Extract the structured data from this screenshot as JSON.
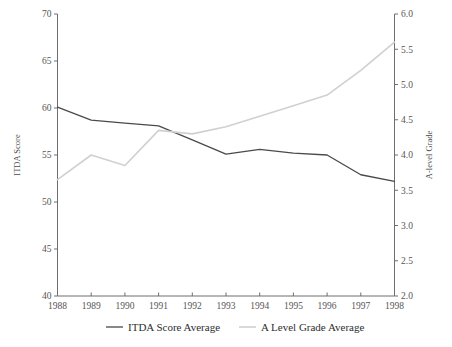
{
  "chart_data": {
    "type": "line",
    "title": "",
    "xlabel": "",
    "ylabel": "ITDA Score",
    "y2label": "A-level Grade",
    "grid": false,
    "legend_position": "bottom",
    "categories": [
      1988,
      1989,
      1990,
      1991,
      1992,
      1993,
      1994,
      1995,
      1996,
      1997,
      1998
    ],
    "x_tick_labels": [
      "1988",
      "1989",
      "1990",
      "1991",
      "1992",
      "1993",
      "1994",
      "1995",
      "1996",
      "1997",
      "1998"
    ],
    "ylim": [
      40,
      70
    ],
    "y_tick_labels": [
      "40",
      "45",
      "50",
      "55",
      "60",
      "65",
      "70"
    ],
    "y_ticks": [
      40,
      45,
      50,
      55,
      60,
      65,
      70
    ],
    "y2lim": [
      2.0,
      6.0
    ],
    "y2_tick_labels": [
      "2.0",
      "2.5",
      "3.0",
      "3.5",
      "4.0",
      "4.5",
      "5.0",
      "5.5",
      "6.0"
    ],
    "y2_ticks": [
      2.0,
      2.5,
      3.0,
      3.5,
      4.0,
      4.5,
      5.0,
      5.5,
      6.0
    ],
    "series": [
      {
        "name": "ITDA Score Average",
        "axis": "left",
        "color": "#4a4a4a",
        "values": [
          60.1,
          58.7,
          58.4,
          58.1,
          56.6,
          55.1,
          55.6,
          55.2,
          55.0,
          52.9,
          52.2
        ]
      },
      {
        "name": "A Level Grade Average",
        "axis": "right",
        "color": "#d0d0d0",
        "values": [
          3.65,
          4.0,
          3.85,
          4.35,
          4.3,
          4.4,
          4.55,
          4.7,
          4.85,
          5.2,
          5.6
        ]
      }
    ]
  },
  "legend": {
    "items": [
      {
        "label": "ITDA Score Average",
        "color": "#4a4a4a"
      },
      {
        "label": "A Level Grade Average",
        "color": "#d0d0d0"
      }
    ]
  },
  "axes": {
    "left_title": "ITDA Score",
    "right_title": "A-level Grade"
  }
}
